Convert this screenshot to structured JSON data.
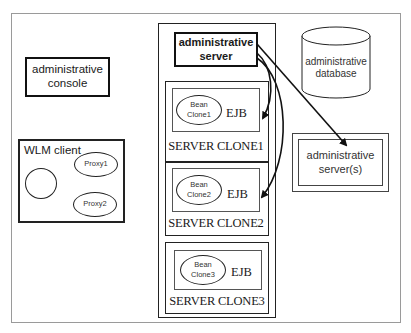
{
  "diagram": {
    "admin_console": {
      "line1": "administrative",
      "line2": "console"
    },
    "wlm_client": {
      "title": "WLM client",
      "proxies": [
        "Proxy1",
        "Proxy2"
      ]
    },
    "admin_server": {
      "line1": "administrative",
      "line2": "server"
    },
    "server_clones": [
      {
        "label": "SERVER CLONE1",
        "bean_line1": "Bean",
        "bean_line2": "Clone1",
        "ejb": "EJB"
      },
      {
        "label": "SERVER CLONE2",
        "bean_line1": "Bean",
        "bean_line2": "Clone2",
        "ejb": "EJB"
      },
      {
        "label": "SERVER CLONE3",
        "bean_line1": "Bean",
        "bean_line2": "Clone3",
        "ejb": "EJB"
      }
    ],
    "admin_database": {
      "line1": "administrative",
      "line2": "database"
    },
    "admin_servers_remote": {
      "line1": "administrative",
      "line2": "server(s)"
    },
    "connections": [
      {
        "from": "administrative server",
        "to": "administrative server(s)",
        "style": "straight-arrow"
      },
      {
        "from": "administrative server",
        "to": "SERVER CLONE1 EJB",
        "style": "curved-arrow"
      },
      {
        "from": "administrative server",
        "to": "SERVER CLONE2 EJB",
        "style": "curved-arrow"
      }
    ],
    "colors": {
      "line": "#111111",
      "frame": "#9a9a9a",
      "background": "#ffffff"
    }
  }
}
